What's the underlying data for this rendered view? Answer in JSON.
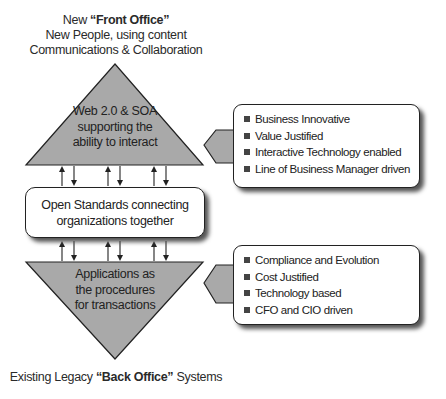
{
  "top_caption": {
    "line1_prefix": "New ",
    "line1_bold": "“Front Office”",
    "line2": "New People, using content",
    "line3": "Communications & Collaboration"
  },
  "top_triangle": {
    "lines": [
      "Web 2.0 & SOA",
      "supporting the",
      "ability to interact"
    ]
  },
  "middle_box": {
    "lines": [
      "Open Standards connecting",
      "organizations together"
    ]
  },
  "bottom_triangle": {
    "lines": [
      "Applications as",
      "the procedures",
      "for transactions"
    ]
  },
  "bottom_caption": {
    "prefix": "Existing Legacy ",
    "bold": "“Back Office”",
    "suffix": " Systems"
  },
  "top_callout": {
    "items": [
      "Business Innovative",
      "Value Justified",
      "Interactive Technology enabled",
      "Line of Business Manager driven"
    ]
  },
  "bottom_callout": {
    "items": [
      "Compliance and Evolution",
      "Cost Justified",
      "Technology based",
      "CFO and CIO driven"
    ]
  },
  "colors": {
    "shape_fill": "#a9a9a9",
    "outline": "#222222",
    "box_fill": "#ffffff"
  }
}
